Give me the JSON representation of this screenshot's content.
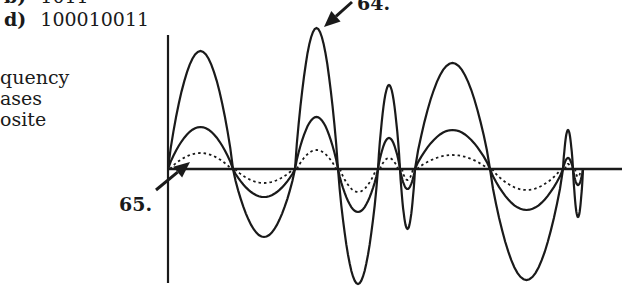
{
  "answer_options": {
    "b": {
      "letter": "b)",
      "value": "1011"
    },
    "d": {
      "letter": "d)",
      "value": "100010011"
    }
  },
  "side_text": [
    "quency",
    "ases",
    "osite"
  ],
  "labels": {
    "q64": "64.",
    "q65": "65."
  },
  "diagram": {
    "axis_origin": [
      168,
      169
    ],
    "axis_top": 35,
    "axis_bottom": 283,
    "axis_right": 622,
    "stroke_color": "#1a1a1a",
    "segments": [
      {
        "x0": 168,
        "x1": 233,
        "big": 51,
        "mid": 127,
        "dot": 153
      },
      {
        "x0": 233,
        "x1": 295,
        "big": 237,
        "mid": 197,
        "dot": 183
      },
      {
        "x0": 295,
        "x1": 338,
        "big": 28,
        "mid": 117,
        "dot": 150
      },
      {
        "x0": 338,
        "x1": 378,
        "big": 284,
        "mid": 212,
        "dot": 192
      },
      {
        "x0": 378,
        "x1": 400,
        "big": 85,
        "mid": 138,
        "dot": 158
      },
      {
        "x0": 400,
        "x1": 415,
        "big": 229,
        "mid": 189,
        "dot": 180
      },
      {
        "x0": 415,
        "x1": 490,
        "big": 63,
        "mid": 130,
        "dot": 155
      },
      {
        "x0": 490,
        "x1": 563,
        "big": 280,
        "mid": 210,
        "dot": 190
      },
      {
        "x0": 563,
        "x1": 573,
        "big": 130,
        "mid": 158,
        "dot": 164
      },
      {
        "x0": 573,
        "x1": 583,
        "big": 217,
        "mid": 185,
        "dot": 177
      }
    ],
    "arrow_64": {
      "from": [
        352,
        2
      ],
      "to": [
        324,
        27
      ]
    },
    "arrow_65": {
      "from": [
        156,
        190
      ],
      "to": [
        190,
        162
      ]
    }
  }
}
